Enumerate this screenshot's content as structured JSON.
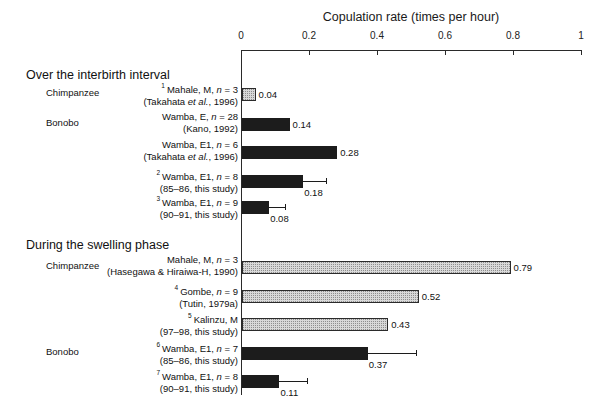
{
  "chart_data": {
    "type": "bar",
    "title": "Copulation rate (times per hour)",
    "xlabel": "Copulation rate (times per hour)",
    "ylabel": "",
    "orientation": "horizontal",
    "xlim": [
      0,
      1
    ],
    "xticks": [
      "0",
      "0.2",
      "0.4",
      "0.6",
      "0.8",
      "1"
    ],
    "xtick_values": [
      0,
      0.2,
      0.4,
      0.6,
      0.8,
      1
    ],
    "grid": false,
    "legend": "none",
    "sections": [
      {
        "header": "Over the interbirth interval",
        "groups": [
          {
            "species": "Chimpanzee",
            "rows": [
              {
                "note": "1",
                "line1": "Mahale, M, n = 3",
                "line2": "(Takahata et al., 1996)",
                "value": 0.04,
                "value_label": "0.04",
                "fill": "light",
                "error": null
              }
            ]
          },
          {
            "species": "Bonobo",
            "rows": [
              {
                "note": "",
                "line1": "Wamba, E, n = 28",
                "line2": "(Kano, 1992)",
                "value": 0.14,
                "value_label": "0.14",
                "fill": "dark",
                "error": null
              },
              {
                "note": "",
                "line1": "Wamba, E1, n = 6",
                "line2": "(Takahata et al., 1996)",
                "value": 0.28,
                "value_label": "0.28",
                "fill": "dark",
                "error": null
              },
              {
                "note": "2",
                "line1": "Wamba, E1, n = 8",
                "line2": "(85–86, this study)",
                "value": 0.18,
                "value_label": "0.18",
                "fill": "dark",
                "error": 0.25
              },
              {
                "note": "3",
                "line1": "Wamba, E1, n = 9",
                "line2": "(90–91, this study)",
                "value": 0.08,
                "value_label": "0.08",
                "fill": "dark",
                "error": 0.13
              }
            ]
          }
        ]
      },
      {
        "header": "During the swelling phase",
        "groups": [
          {
            "species": "Chimpanzee",
            "rows": [
              {
                "note": "",
                "line1": "Mahale, M, n = 3",
                "line2": "(Hasegawa & Hiraiwa-H, 1990)",
                "value": 0.79,
                "value_label": "0.79",
                "fill": "light",
                "error": null
              },
              {
                "note": "4",
                "line1": "Gombe, n = 9",
                "line2": "(Tutin, 1979a)",
                "value": 0.52,
                "value_label": "0.52",
                "fill": "light",
                "error": null
              },
              {
                "note": "5",
                "line1": "Kalinzu, M",
                "line2": "(97–98, this study)",
                "value": 0.43,
                "value_label": "0.43",
                "fill": "light",
                "error": null
              }
            ]
          },
          {
            "species": "Bonobo",
            "rows": [
              {
                "note": "6",
                "line1": "Wamba, E1, n = 7",
                "line2": "(85–86, this study)",
                "value": 0.37,
                "value_label": "0.37",
                "fill": "dark",
                "error": 0.515
              },
              {
                "note": "7",
                "line1": "Wamba, E1, n = 8",
                "line2": "(90–91, this study)",
                "value": 0.11,
                "value_label": "0.11",
                "fill": "dark",
                "error": 0.195
              }
            ]
          }
        ]
      }
    ]
  },
  "colors": {
    "axis": "#2a2a2a",
    "bar_dark": "#1c1c1c",
    "bar_light": "#d8d8d8",
    "text": "#111111"
  }
}
